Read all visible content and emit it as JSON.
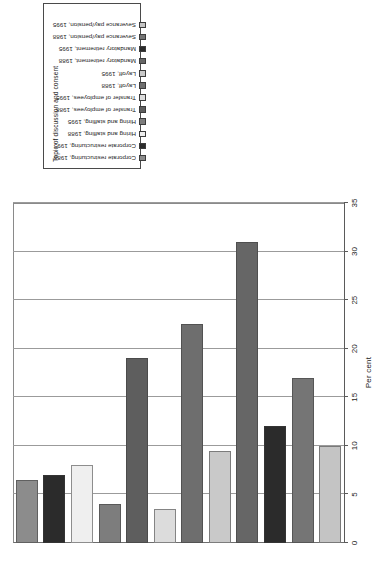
{
  "legend": {
    "title": "Topic of discussion and consent",
    "items": [
      {
        "label": "Corporate restructuring, 1988",
        "color": "#8c8c8c"
      },
      {
        "label": "Corporate restructuring, 1995",
        "color": "#2b2b2b"
      },
      {
        "label": "Hiring and staffing, 1988",
        "color": "#efefef"
      },
      {
        "label": "Hiring and staffing, 1995",
        "color": "#7d7d7d"
      },
      {
        "label": "Transfer of employees, 1988",
        "color": "#5e5e5e"
      },
      {
        "label": "Transfer of employees, 1995",
        "color": "#dcdcdc"
      },
      {
        "label": "Layoff, 1988",
        "color": "#6e6e6e"
      },
      {
        "label": "Layoff, 1995",
        "color": "#c9c9c9"
      },
      {
        "label": "Mandatory retirement, 1988",
        "color": "#666666"
      },
      {
        "label": "Mandatory retirement, 1995",
        "color": "#2b2b2b"
      },
      {
        "label": "Severance pay/pension, 1988",
        "color": "#757575"
      },
      {
        "label": "Severance pay/pension, 1995",
        "color": "#c4c4c4"
      }
    ]
  },
  "chart_data": {
    "type": "bar",
    "orientation": "horizontal",
    "title": "",
    "xlabel": "Per cent",
    "ylabel": "",
    "xlim": [
      0,
      35
    ],
    "xticks": [
      0,
      5,
      10,
      15,
      20,
      25,
      30,
      35
    ],
    "ticklabels": [
      "0",
      "5",
      "10",
      "15",
      "20",
      "25",
      "30",
      "35"
    ],
    "grid": true,
    "legend_position": "top",
    "categories": [
      "Corporate restructuring, 1988",
      "Corporate restructuring, 1995",
      "Hiring and staffing, 1988",
      "Hiring and staffing, 1995",
      "Transfer of employees, 1988",
      "Transfer of employees, 1995",
      "Layoff, 1988",
      "Layoff, 1995",
      "Mandatory retirement, 1988",
      "Mandatory retirement, 1995",
      "Severance pay/pension, 1988",
      "Severance pay/pension, 1995"
    ],
    "values": [
      6.5,
      7.0,
      8.0,
      4.0,
      19.0,
      3.5,
      22.5,
      9.5,
      31.0,
      12.0,
      17.0,
      10.0
    ],
    "colors": [
      "#8c8c8c",
      "#2b2b2b",
      "#efefef",
      "#7d7d7d",
      "#5e5e5e",
      "#dcdcdc",
      "#6e6e6e",
      "#c9c9c9",
      "#666666",
      "#2b2b2b",
      "#757575",
      "#c4c4c4"
    ]
  }
}
